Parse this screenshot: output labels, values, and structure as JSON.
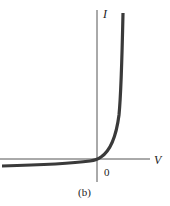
{
  "figure": {
    "caption": "(b)",
    "axes": {
      "y_label": "I",
      "x_label": "V",
      "origin_label": "0"
    },
    "curve": {
      "description": "Diode I-V characteristic: near-zero current for negative voltage, exponential rise for positive voltage",
      "color": "#3a3a3a"
    },
    "axis_color": "#555555"
  }
}
